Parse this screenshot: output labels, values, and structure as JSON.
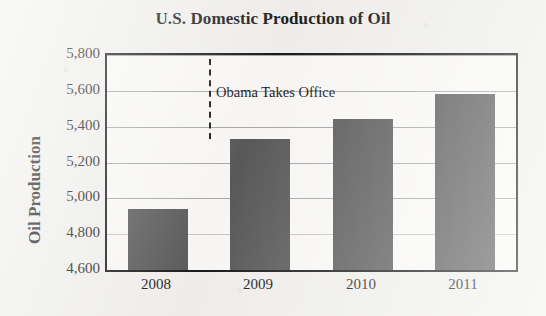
{
  "chart_data": {
    "type": "bar",
    "title": "U.S. Domestic Production of Oil",
    "xlabel": "",
    "ylabel": "Oil Production",
    "categories": [
      "2008",
      "2009",
      "2010",
      "2011"
    ],
    "values": [
      4940,
      5330,
      5445,
      5580
    ],
    "ylim": [
      4600,
      5800
    ],
    "ytick_labels": [
      "5,800",
      "5,600",
      "5,400",
      "5,200",
      "5,000",
      "4,800",
      "4,600"
    ],
    "ytick_values": [
      5800,
      5600,
      5400,
      5200,
      5000,
      4800,
      4600
    ],
    "grid": true,
    "legend": null,
    "bar_color": "#5a5a5a",
    "annotations": [
      {
        "text": "Obama Takes Office",
        "type": "vertical-dashed-line-with-label",
        "x_position_between": [
          "2008",
          "2009"
        ],
        "x_value": 2008.5
      }
    ]
  },
  "figure": {
    "background_color": "#f2f1ef",
    "plot_background_color": "#fbfaf8",
    "frame_color": "#1a1a1a",
    "gridline_color": "#a9a9a9"
  }
}
